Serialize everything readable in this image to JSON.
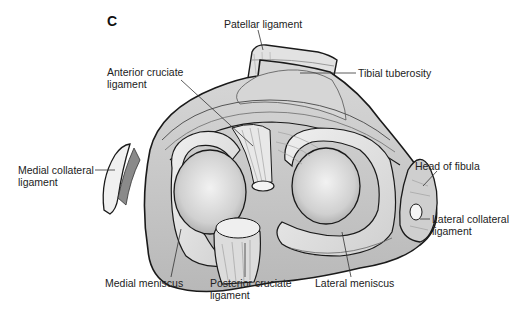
{
  "figure": {
    "panel_letter": "C",
    "view": "Superior view of tibial plateau with menisci and ligaments",
    "labels": {
      "patellar_ligament": "Patellar ligament",
      "anterior_cruciate_1": "Anterior cruciate",
      "anterior_cruciate_2": "ligament",
      "tibial_tuberosity": "Tibial tuberosity",
      "medial_collateral_1": "Medial collateral",
      "medial_collateral_2": "ligament",
      "head_of_fibula": "Head of fibula",
      "lateral_collateral_1": "Lateral collateral",
      "lateral_collateral_2": "ligament",
      "medial_meniscus": "Medial meniscus",
      "posterior_cruciate_1": "Posterior cruciate",
      "posterior_cruciate_2": "ligament",
      "lateral_meniscus": "Lateral meniscus"
    }
  },
  "colors": {
    "outline": "#1a1a1a",
    "tissue_light": "#e6e6e6",
    "tissue_mid": "#c9c9c9",
    "tissue_dark": "#9a9a9a",
    "condyle": "#d4d4d4",
    "leader": "#333333"
  }
}
